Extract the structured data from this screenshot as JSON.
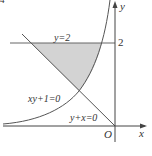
{
  "figure": {
    "corner_mark": "4",
    "axes": {
      "x_label": "x",
      "y_label": "y",
      "origin_label": "O",
      "y_tick_label": "2"
    },
    "curves": [
      {
        "name": "horizontal-line",
        "label": "y=2"
      },
      {
        "name": "hyperbola",
        "label": "xy+1=0"
      },
      {
        "name": "diagonal-line",
        "label": "y+x=0"
      }
    ],
    "shaded_region": {
      "description": "region bounded by y=2, y+x=0 and xy+1=0",
      "fill": "#d3d3d3"
    },
    "colors": {
      "stroke": "#555555",
      "shade": "#d3d3d3",
      "text": "#333333"
    }
  }
}
